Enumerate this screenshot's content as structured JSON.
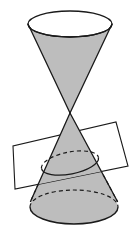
{
  "figure": {
    "type": "geometric-diagram",
    "canvas": {
      "width": 140,
      "height": 235,
      "background": "#ffffff"
    },
    "colors": {
      "cone_fill": "#bdbdbd",
      "plane_fill": "#ffffff",
      "outline": "#1a1a1a",
      "hidden_edge": "#1a1a1a",
      "background": "#ffffff"
    },
    "stroke": {
      "outline_width": 1.3,
      "hidden_width": 1.2,
      "dash_pattern": "4 3"
    },
    "parts": {
      "upper_cone": {
        "label": "upper nappe",
        "top_ellipse": {
          "cx": 70,
          "cy": 24,
          "rx": 42,
          "ry": 13
        },
        "apex": {
          "x": 70,
          "y": 113
        },
        "fill": "#bdbdbd",
        "top_face_fill": "#ffffff"
      },
      "lower_cone": {
        "label": "lower nappe",
        "base_ellipse": {
          "cx": 74,
          "cy": 207,
          "rx": 44,
          "ry": 17
        },
        "apex": {
          "x": 70,
          "y": 113
        },
        "fill": "#bdbdbd"
      },
      "cutting_plane": {
        "label": "cutting plane",
        "corners": [
          {
            "x": 116,
            "y": 122
          },
          {
            "x": 128,
            "y": 166
          },
          {
            "x": 15,
            "y": 189
          },
          {
            "x": 13,
            "y": 146
          }
        ],
        "fill": "#ffffff",
        "opacity": 1
      },
      "intersection_curve": {
        "label": "ellipse of intersection",
        "cx": 70,
        "cy": 163,
        "rx": 29,
        "ry": 11,
        "rotation_deg": -11,
        "front_arc_style": "solid",
        "back_arc_style": "dashed"
      }
    },
    "annotations": []
  }
}
